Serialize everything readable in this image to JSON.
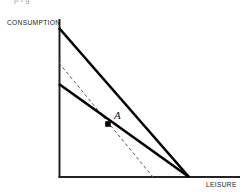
{
  "figure": {
    "title_remnant": "p          t               g",
    "axes": {
      "y_label": "CONSUMPTION",
      "x_label": "LEISURE"
    },
    "annotations": {
      "point_a_label": "A"
    },
    "colors": {
      "line": "#000000",
      "axis": "#222222",
      "dashed": "#555555",
      "background": "#ffffff"
    }
  },
  "chart_data": {
    "type": "line",
    "title": "",
    "xlabel": "LEISURE",
    "ylabel": "CONSUMPTION",
    "xlim": [
      0,
      1
    ],
    "ylim": [
      0,
      1
    ],
    "grid": false,
    "legend": null,
    "axis": {
      "origin": [
        59,
        177
      ],
      "y_axis_top": [
        59,
        19
      ],
      "x_axis_right": [
        240,
        177
      ]
    },
    "series": [
      {
        "name": "new-budget-line",
        "style": "solid",
        "width": 2.6,
        "points": [
          [
            59,
            28
          ],
          [
            189,
            177
          ]
        ]
      },
      {
        "name": "original-budget-line",
        "style": "solid",
        "width": 2.6,
        "points": [
          [
            59,
            84
          ],
          [
            189,
            177
          ]
        ]
      },
      {
        "name": "compensated-budget-line",
        "style": "dashed",
        "width": 1.0,
        "points": [
          [
            59,
            63
          ],
          [
            153,
            177
          ]
        ]
      }
    ],
    "points": [
      {
        "name": "A",
        "label": "A",
        "marker": "square",
        "coords": [
          108,
          124
        ]
      }
    ]
  }
}
